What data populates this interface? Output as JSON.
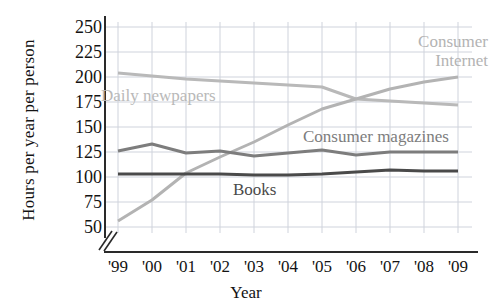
{
  "chart_data": {
    "type": "line",
    "title": "",
    "xlabel": "Year",
    "ylabel": "Hours per year per person",
    "x": [
      "'99",
      "'00",
      "'01",
      "'02",
      "'03",
      "'04",
      "'05",
      "'06",
      "'07",
      "'08",
      "'09"
    ],
    "xtick_labels": [
      "'99",
      "'00",
      "'01",
      "'02",
      "'03",
      "'04",
      "'05",
      "'06",
      "'07",
      "'08",
      "'09"
    ],
    "ytick_labels": [
      "250",
      "225",
      "200",
      "175",
      "150",
      "125",
      "100",
      "75",
      "50"
    ],
    "ytick_values": [
      250,
      225,
      200,
      175,
      150,
      125,
      100,
      75,
      50
    ],
    "ylim": [
      50,
      250
    ],
    "y_axis_broken": true,
    "grid": true,
    "legend": "in-plot labels",
    "series": [
      {
        "name": "Daily newpapers",
        "color": "#b9b9b9",
        "label_position": "upper-left",
        "values": [
          204,
          201,
          198,
          196,
          194,
          192,
          190,
          178,
          176,
          174,
          172
        ]
      },
      {
        "name": "Consumer Internet",
        "color": "#b3b3b3",
        "label_position": "upper-right",
        "values": [
          56,
          77,
          104,
          120,
          135,
          152,
          168,
          178,
          188,
          195,
          200
        ]
      },
      {
        "name": "Consumer magazines",
        "color": "#7d7d7d",
        "label_position": "middle-right",
        "values": [
          126,
          133,
          124,
          126,
          121,
          124,
          127,
          122,
          125,
          125,
          125
        ]
      },
      {
        "name": "Books",
        "color": "#4a4a4a",
        "label_position": "middle-center",
        "values": [
          103,
          103,
          103,
          103,
          102,
          102,
          103,
          105,
          107,
          106,
          106
        ]
      }
    ]
  },
  "axis": {
    "ylabel": "Hours per year per person",
    "xlabel": "Year"
  },
  "labels": {
    "newspapers": "Daily newpapers",
    "internet_line1": "Consumer",
    "internet_line2": "Internet",
    "magazines": "Consumer magazines",
    "books": "Books"
  }
}
